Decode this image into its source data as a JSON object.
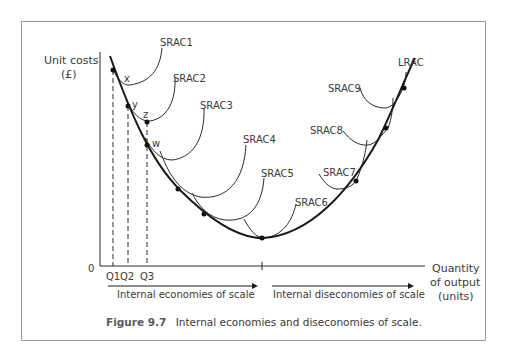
{
  "figure": {
    "number": "Figure 9.7",
    "caption": "Internal economies and diseconomies of scale."
  },
  "axes": {
    "y_label_line1": "Unit costs",
    "y_label_line2": "(£)",
    "x_label_line1": "Quantity",
    "x_label_line2": "of output",
    "x_label_line3": "(units)",
    "origin": "0",
    "x_ticks": [
      "Q1",
      "Q2",
      "Q3"
    ]
  },
  "curves": {
    "lrac": "LRAC",
    "srac": [
      "SRAC1",
      "SRAC2",
      "SRAC3",
      "SRAC4",
      "SRAC5",
      "SRAC6",
      "SRAC7",
      "SRAC8",
      "SRAC9"
    ]
  },
  "points": [
    "x",
    "y",
    "z",
    "w"
  ],
  "arrows": {
    "economies": "Internal economies of scale",
    "diseconomies": "Internal diseconomies of scale"
  },
  "colors": {
    "frame_border": "#9a9a9a",
    "line": "#2a2a2a",
    "text": "#3a3a3a"
  }
}
